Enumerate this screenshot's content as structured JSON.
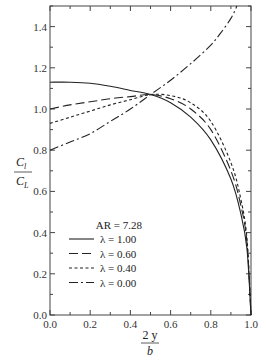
{
  "chart_data": {
    "type": "line",
    "title": "",
    "xlabel": "2y/b",
    "ylabel": "Cl/CL",
    "xlabel_num": "2 y",
    "xlabel_den": "b",
    "ylabel_num": "C",
    "ylabel_num_sub": "l",
    "ylabel_den": "C",
    "ylabel_den_sub": "L",
    "xlim": [
      0.0,
      1.0
    ],
    "ylim": [
      0.0,
      1.5
    ],
    "xticks": [
      "0.0",
      "0.2",
      "0.4",
      "0.6",
      "0.8",
      "1.0"
    ],
    "yticks": [
      "0.0",
      "0.2",
      "0.4",
      "0.6",
      "0.8",
      "1.0",
      "1.2",
      "1.4"
    ],
    "grid": false,
    "legend_position": "lower-left inside",
    "legend_title": "AR = 7.28",
    "series": [
      {
        "name": "λ = 1.00",
        "style": "solid",
        "x": [
          0.0,
          0.1,
          0.2,
          0.3,
          0.4,
          0.5,
          0.6,
          0.7,
          0.8,
          0.9,
          0.95,
          0.98,
          1.0
        ],
        "y": [
          1.13,
          1.13,
          1.125,
          1.11,
          1.09,
          1.07,
          1.03,
          0.96,
          0.85,
          0.66,
          0.49,
          0.32,
          0.0
        ]
      },
      {
        "name": "λ = 0.60",
        "style": "dashed",
        "x": [
          0.0,
          0.1,
          0.2,
          0.3,
          0.4,
          0.5,
          0.6,
          0.7,
          0.8,
          0.9,
          0.95,
          0.98,
          1.0
        ],
        "y": [
          1.0,
          1.02,
          1.035,
          1.05,
          1.06,
          1.07,
          1.05,
          1.0,
          0.9,
          0.7,
          0.53,
          0.35,
          0.0
        ]
      },
      {
        "name": "λ = 0.40",
        "style": "short-dashed",
        "x": [
          0.0,
          0.1,
          0.2,
          0.3,
          0.4,
          0.5,
          0.6,
          0.7,
          0.8,
          0.9,
          0.95,
          0.98,
          1.0
        ],
        "y": [
          0.93,
          0.96,
          0.99,
          1.02,
          1.045,
          1.07,
          1.065,
          1.03,
          0.94,
          0.74,
          0.56,
          0.37,
          0.0
        ]
      },
      {
        "name": "λ = 0.00",
        "style": "dash-dot",
        "x": [
          0.0,
          0.1,
          0.2,
          0.3,
          0.4,
          0.5,
          0.6,
          0.7,
          0.8,
          0.85,
          0.9,
          0.93
        ],
        "y": [
          0.8,
          0.84,
          0.88,
          0.94,
          1.0,
          1.07,
          1.14,
          1.22,
          1.31,
          1.37,
          1.44,
          1.5
        ]
      }
    ]
  }
}
